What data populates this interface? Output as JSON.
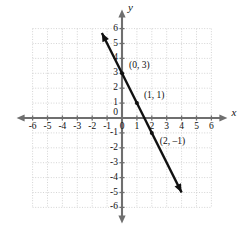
{
  "chart_data": {
    "type": "line",
    "title": "",
    "xlabel": "x",
    "ylabel": "y",
    "xlim": [
      -6,
      6
    ],
    "ylim": [
      -6,
      6
    ],
    "grid": true,
    "grid_step": 1,
    "legend": "none",
    "equation": "y = -2x + 3",
    "slope": -2,
    "intercept": 3,
    "x_ticks": [
      "-6",
      "-5",
      "-4",
      "-3",
      "-2",
      "-1",
      "0",
      "1",
      "2",
      "3",
      "4",
      "5",
      "6"
    ],
    "y_ticks": [
      "6",
      "5",
      "4",
      "3",
      "2",
      "1",
      "-1",
      "-2",
      "-3",
      "-4",
      "-5",
      "-6"
    ],
    "x_tick_values": [
      -6,
      -5,
      -4,
      -3,
      -2,
      -1,
      0,
      1,
      2,
      3,
      4,
      5,
      6
    ],
    "y_tick_values": [
      6,
      5,
      4,
      3,
      2,
      1,
      -1,
      -2,
      -3,
      -4,
      -5,
      -6
    ],
    "series": [
      {
        "name": "line",
        "x": [
          -1.35,
          4.0
        ],
        "y": [
          5.7,
          -5.0
        ],
        "arrows": "both",
        "color": "#111111"
      }
    ],
    "points": [
      {
        "label": "(0, 3)",
        "x": 0,
        "y": 3,
        "label_dx": 7,
        "label_dy": -12
      },
      {
        "label": "(1, 1)",
        "x": 1,
        "y": 1,
        "label_dx": 7,
        "label_dy": -12
      },
      {
        "label": "(2, –1)",
        "x": 2,
        "y": -1,
        "label_dx": 8,
        "label_dy": 4
      }
    ],
    "axis_arrow_labels": {
      "x": "x",
      "y": "y"
    },
    "colors": {
      "grid": "#c9c9c9",
      "axis": "#6f6f6f",
      "line": "#111111",
      "text": "#111111",
      "background": "#ffffff"
    }
  }
}
